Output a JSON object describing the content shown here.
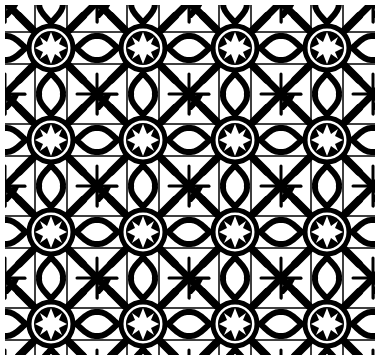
{
  "image": {
    "description": "Seamless black-and-white ornamental tile pattern with eight-pointed stars and interlaced quatrefoil cross motifs",
    "colors": {
      "ink": "#000000",
      "background": "#ffffff"
    },
    "tile_size_px": 92,
    "pattern_bounds": {
      "x": 5,
      "y": 5,
      "width": 370,
      "height": 350
    },
    "motifs": [
      "eight-pointed-star",
      "interlaced-cross",
      "heart-scroll",
      "quatrefoil"
    ]
  }
}
